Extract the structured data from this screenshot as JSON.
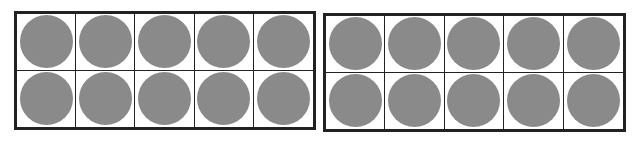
{
  "colors": {
    "counter": "#8a8a8a",
    "border": "#222222",
    "background": "#ffffff"
  },
  "frames": [
    {
      "name": "left",
      "rows": 2,
      "cols": 5,
      "filled": 10,
      "total": 10
    },
    {
      "name": "right",
      "rows": 2,
      "cols": 5,
      "filled": 10,
      "total": 10
    }
  ],
  "total_counters": 20
}
